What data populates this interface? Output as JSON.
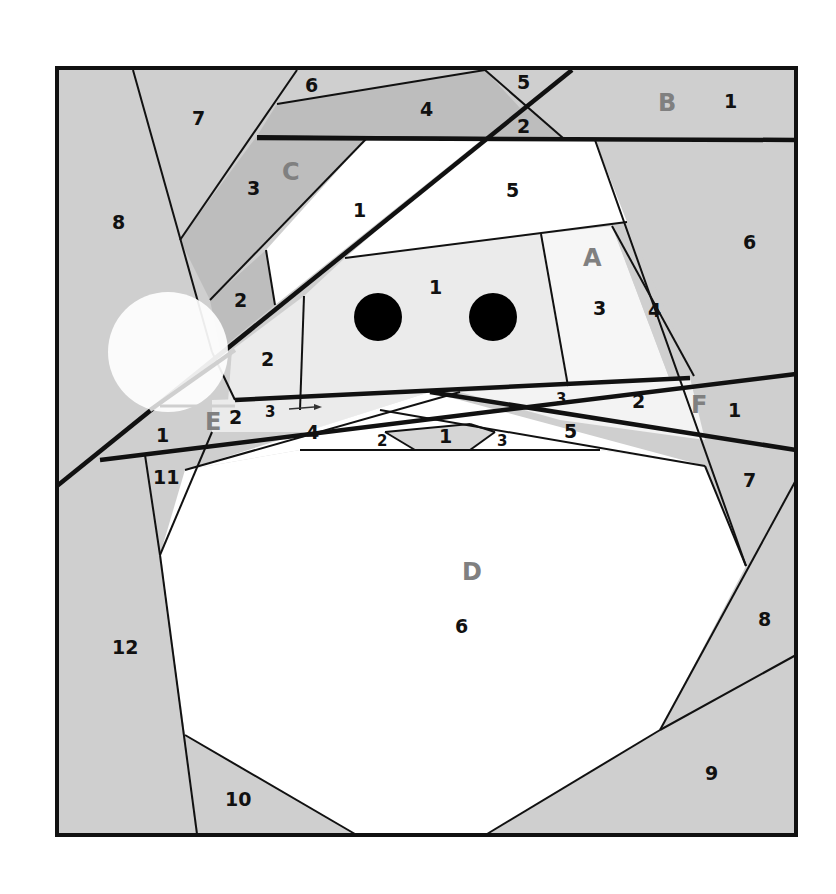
{
  "diagram": {
    "type": "foundation paper piecing pattern",
    "colors": {
      "background": "#cfcfcf",
      "dark_piece": "#bdbdbd",
      "face": "#ebebeb",
      "white": "#ffffff",
      "line": "#111111",
      "section_label": "#808080"
    },
    "sections": {
      "A": {
        "label": "A",
        "pieces": [
          "1",
          "2",
          "3",
          "4",
          "5",
          "6"
        ]
      },
      "B": {
        "label": "B",
        "pieces": [
          "1",
          "2",
          "4",
          "5",
          "6",
          "7",
          "8"
        ]
      },
      "C": {
        "label": "C",
        "pieces": [
          "1",
          "2",
          "3"
        ]
      },
      "D": {
        "label": "D",
        "pieces": [
          "1",
          "2",
          "3",
          "4",
          "5",
          "6",
          "7",
          "8",
          "9",
          "10",
          "11",
          "12"
        ]
      },
      "E": {
        "label": "E",
        "pieces": [
          "1",
          "2",
          "3"
        ]
      },
      "F": {
        "label": "F",
        "pieces": [
          "1"
        ]
      }
    },
    "labels": {
      "b6": "6",
      "b7": "7",
      "b4": "4",
      "b5": "5",
      "b2": "2",
      "b1": "1",
      "b8": "8",
      "c3": "3",
      "c1": "1",
      "c2": "2",
      "a5": "5",
      "a1": "1",
      "a3": "3",
      "a4": "4",
      "a6": "6",
      "a2": "2",
      "e2": "2",
      "e3": "3",
      "e1": "1",
      "a2b": "2",
      "a3b": "3",
      "f1": "1",
      "d4": "4",
      "d2": "2",
      "d1": "1",
      "d3": "3",
      "d5": "5",
      "d11": "11",
      "d7": "7",
      "d6": "6",
      "d8": "8",
      "d12": "12",
      "d9": "9",
      "d10": "10",
      "secA": "A",
      "secB": "B",
      "secC": "C",
      "secD": "D",
      "secE": "E",
      "secF": "F"
    },
    "eyes": 2
  }
}
